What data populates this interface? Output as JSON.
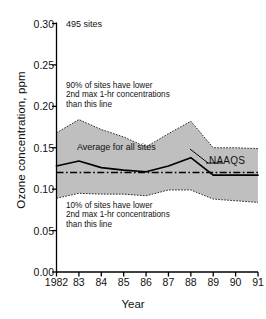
{
  "chart_data": {
    "type": "area",
    "title": "",
    "xlabel": "Year",
    "ylabel": "Ozone concentration, ppm",
    "x": [
      1982,
      1983,
      1984,
      1985,
      1986,
      1987,
      1988,
      1989,
      1990,
      1991
    ],
    "categories": [
      "1982",
      "83",
      "84",
      "85",
      "86",
      "87",
      "88",
      "89",
      "90",
      "91"
    ],
    "xlim": [
      1982,
      1991
    ],
    "ylim": [
      0.0,
      0.3
    ],
    "yticks": [
      "0.00",
      "0.05",
      "0.10",
      "0.15",
      "0.20",
      "0.25",
      "0.30"
    ],
    "ytick_values": [
      0.0,
      0.05,
      0.1,
      0.15,
      0.2,
      0.25,
      0.3
    ],
    "grid": false,
    "legend_position": "inline-annotations",
    "band_fill_color": "#bfbfbf",
    "line_color": "#000000",
    "series": [
      {
        "name": "90th percentile",
        "style": "dotted-band-upper",
        "values": [
          0.168,
          0.184,
          0.172,
          0.163,
          0.151,
          0.167,
          0.182,
          0.15,
          0.15,
          0.149
        ]
      },
      {
        "name": "Average for all sites",
        "style": "solid",
        "values": [
          0.128,
          0.134,
          0.126,
          0.123,
          0.121,
          0.128,
          0.138,
          0.117,
          0.117,
          0.117
        ]
      },
      {
        "name": "10th percentile",
        "style": "dotted-band-lower",
        "values": [
          0.089,
          0.095,
          0.094,
          0.094,
          0.092,
          0.099,
          0.099,
          0.088,
          0.086,
          0.084
        ]
      }
    ],
    "reference_line": {
      "name": "NAAQS",
      "value": 0.12,
      "style": "dash-dot"
    },
    "annotations": [
      {
        "name": "sites-count",
        "text": "495 sites"
      },
      {
        "name": "upper-band-note",
        "text": "90% of sites have lower\n2nd max 1-hr concentrations\nthan this line"
      },
      {
        "name": "lower-band-note",
        "text": "10% of sites have lower\n2nd max 1-hr concentrations\nthan this line"
      },
      {
        "name": "average-label",
        "text": "Average for all sites"
      },
      {
        "name": "naaqs-label",
        "text": "NAAQS"
      }
    ]
  },
  "axes": {
    "y_title": "Ozone concentration, ppm",
    "x_title": "Year",
    "y_tick_labels": [
      "0.30",
      "0.25",
      "0.20",
      "0.15",
      "0.10",
      "0.05",
      "0.00"
    ],
    "x_tick_labels": [
      "1982",
      "83",
      "84",
      "85",
      "86",
      "87",
      "88",
      "89",
      "90",
      "91"
    ]
  },
  "annotations": {
    "sites": "495 sites",
    "upper_note_line1": "90% of sites have lower",
    "upper_note_line2": "2nd max 1-hr concentrations",
    "upper_note_line3": "than this line",
    "lower_note_line1": "10% of sites have lower",
    "lower_note_line2": "2nd max 1-hr concentrations",
    "lower_note_line3": "than this line",
    "average": "Average for all sites",
    "naaqs": "NAAQS"
  }
}
